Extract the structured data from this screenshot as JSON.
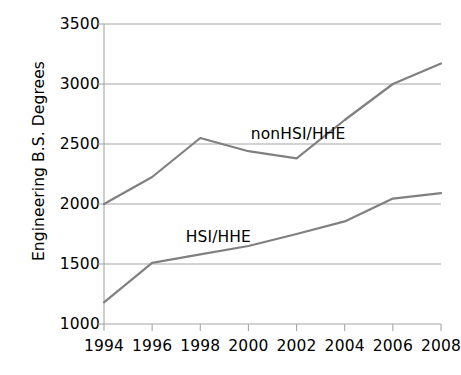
{
  "chart_data": {
    "type": "line",
    "title": "",
    "xlabel": "",
    "ylabel": "Engineering B.S. Degrees",
    "x": [
      1994,
      1996,
      1998,
      2000,
      2002,
      2004,
      2006,
      2008
    ],
    "xtick_labels": [
      "1994",
      "1996",
      "1998",
      "2000",
      "2002",
      "2004",
      "2006",
      "2008"
    ],
    "ytick_labels": [
      "1000",
      "1500",
      "2000",
      "2500",
      "3000",
      "3500"
    ],
    "yticks": [
      1000,
      1500,
      2000,
      2500,
      3000,
      3500
    ],
    "xlim": [
      1994,
      2008
    ],
    "ylim": [
      1000,
      3500
    ],
    "grid": "horizontal",
    "legend": "inline-annotations",
    "series": [
      {
        "name": "nonHSI/HHE",
        "values": [
          2000,
          2225,
          2550,
          2440,
          2380,
          2700,
          3000,
          3170
        ],
        "color": "#808080",
        "label_x": 2000.1,
        "label_y": 2660
      },
      {
        "name": "HSI/HHE",
        "values": [
          1180,
          1510,
          1580,
          1650,
          1750,
          1855,
          2045,
          2090
        ],
        "color": "#808080",
        "label_x": 1997.4,
        "label_y": 1800
      }
    ],
    "axis_color": "#a6a6a6",
    "grid_color": "#a6a6a6",
    "text_color": "#000000",
    "background": "#ffffff"
  }
}
